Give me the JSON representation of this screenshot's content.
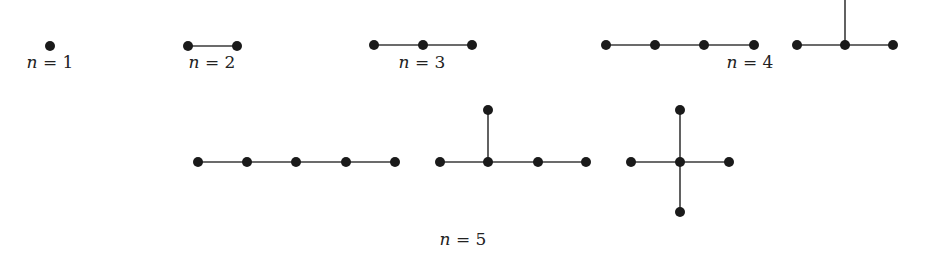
{
  "groups": [
    {
      "n": 1,
      "label_var": "n",
      "label_eq": " = 1",
      "label_x": 50,
      "label_y": 67,
      "trees": [
        {
          "nodes": [
            [
              50,
              46
            ]
          ],
          "edges": []
        }
      ]
    },
    {
      "n": 2,
      "label_var": "n",
      "label_eq": " = 2",
      "label_x": 212,
      "label_y": 67,
      "trees": [
        {
          "nodes": [
            [
              188,
              46
            ],
            [
              237,
              46
            ]
          ],
          "edges": [
            [
              0,
              1
            ]
          ]
        }
      ]
    },
    {
      "n": 3,
      "label_var": "n",
      "label_eq": " = 3",
      "label_x": 422,
      "label_y": 67,
      "trees": [
        {
          "nodes": [
            [
              374,
              45
            ],
            [
              423,
              45
            ],
            [
              472,
              45
            ]
          ],
          "edges": [
            [
              0,
              1
            ],
            [
              1,
              2
            ]
          ]
        }
      ]
    },
    {
      "n": 4,
      "label_var": "n",
      "label_eq": " = 4",
      "label_x": 750,
      "label_y": 67,
      "trees": [
        {
          "nodes": [
            [
              606,
              45
            ],
            [
              655,
              45
            ],
            [
              704,
              45
            ],
            [
              754,
              45
            ]
          ],
          "edges": [
            [
              0,
              1
            ],
            [
              1,
              2
            ],
            [
              2,
              3
            ]
          ]
        },
        {
          "nodes": [
            [
              797,
              45
            ],
            [
              845,
              45
            ],
            [
              893,
              45
            ],
            [
              845,
              -5
            ]
          ],
          "edges": [
            [
              0,
              1
            ],
            [
              1,
              2
            ],
            [
              1,
              3
            ]
          ],
          "hidden_nodes": [
            3
          ]
        }
      ]
    },
    {
      "n": 5,
      "label_var": "n",
      "label_eq": " = 5",
      "label_x": 463,
      "label_y": 244,
      "trees": [
        {
          "nodes": [
            [
              198,
              162
            ],
            [
              247,
              162
            ],
            [
              296,
              162
            ],
            [
              346,
              162
            ],
            [
              395,
              162
            ]
          ],
          "edges": [
            [
              0,
              1
            ],
            [
              1,
              2
            ],
            [
              2,
              3
            ],
            [
              3,
              4
            ]
          ]
        },
        {
          "nodes": [
            [
              440,
              162
            ],
            [
              488,
              162
            ],
            [
              538,
              162
            ],
            [
              586,
              162
            ],
            [
              488,
              110
            ]
          ],
          "edges": [
            [
              0,
              1
            ],
            [
              1,
              2
            ],
            [
              2,
              3
            ],
            [
              1,
              4
            ]
          ]
        },
        {
          "nodes": [
            [
              631,
              162
            ],
            [
              680,
              162
            ],
            [
              729,
              162
            ],
            [
              680,
              110
            ],
            [
              680,
              212
            ]
          ],
          "edges": [
            [
              0,
              1
            ],
            [
              1,
              2
            ],
            [
              1,
              3
            ],
            [
              1,
              4
            ]
          ]
        }
      ]
    }
  ],
  "style": {
    "node_color": "#1a1a1a",
    "edge_color": "#3a3a3a",
    "node_radius": 5
  }
}
